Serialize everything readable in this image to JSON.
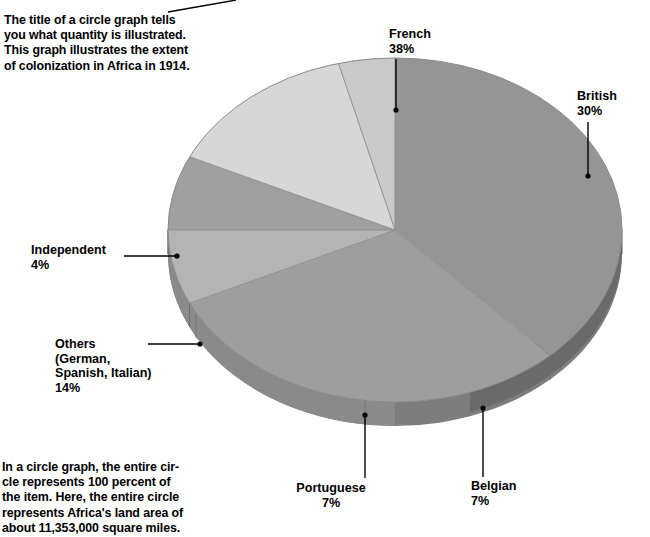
{
  "notes": {
    "top": "The title of a circle graph tells\nyou what quantity is illustrated.\nThis graph illustrates the extent\nof colonization in Africa in 1914.",
    "bottom": "In a circle graph, the entire cir-\ncle represents 100 percent of\nthe item. Here, the entire circle\nrepresents Africa's land area of\nabout 11,353,000 square miles."
  },
  "labels": {
    "french": "French\n38%",
    "british": "British\n30%",
    "independent": "Independent\n4%",
    "others": "Others\n(German,\nSpanish, Italian)\n14%",
    "portuguese": "Portuguese\n7%",
    "belgian": "Belgian\n7%"
  },
  "colors": {
    "french": "#959595",
    "british": "#9e9e9e",
    "belgian": "#b4b4b4",
    "portuguese": "#a0a0a0",
    "others": "#d7d7d7",
    "independent": "#c9c9c9",
    "rim_light": "#7d7d7d",
    "rim_dark": "#6f6f6f",
    "shadow": "#0b0b0b",
    "leader": "#000000",
    "background": "#ffffff"
  },
  "chart_data": {
    "type": "pie",
    "title": "Extent of colonization in Africa in 1914",
    "unit": "percent",
    "total_label": "Africa's land area of about 11,353,000 square miles",
    "categories": [
      "French",
      "British",
      "Belgian",
      "Portuguese",
      "Others (German, Spanish, Italian)",
      "Independent"
    ],
    "values": [
      38,
      30,
      7,
      7,
      14,
      4
    ],
    "value_labels": [
      "38%",
      "30%",
      "7%",
      "7%",
      "14%",
      "4%"
    ],
    "legend": "none",
    "style": "3d-exploded-none",
    "slice_order_clockwise_from_top": [
      "French",
      "British",
      "Belgian",
      "Portuguese",
      "Others (German, Spanish, Italian)",
      "Independent"
    ]
  }
}
